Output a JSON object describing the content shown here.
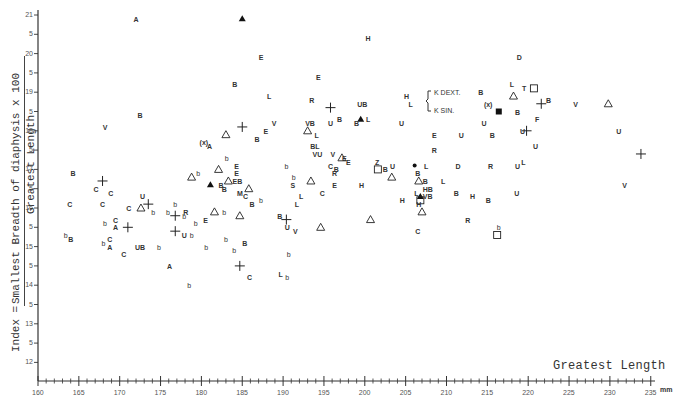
{
  "chart_data": {
    "type": "scatter",
    "title": "",
    "xlabel": "Greatest Length",
    "x_unit": "mm",
    "ylabel": "Index = Smallest Breadth of diaphysis x 100 / Greatest Length",
    "ylabel_parts": {
      "prefix": "Index =",
      "numerator": "Smallest Breadth of diaphysis x 100",
      "denominator": "Greatest Length"
    },
    "xlim": [
      160,
      235
    ],
    "ylim": [
      11.5,
      21.2
    ],
    "x_ticks": [
      "160",
      "165",
      "170",
      "175",
      "180",
      "185",
      "190",
      "195",
      "200",
      "205",
      "210",
      "215",
      "220",
      "225",
      "230",
      "235"
    ],
    "y_ticks": [
      "21",
      "5",
      "20",
      "5",
      "19",
      "5",
      "18",
      "5",
      "17",
      "5",
      "16",
      "5",
      "15",
      "5",
      "14",
      "5",
      "13",
      "5",
      "12"
    ],
    "y_tick_values": [
      21,
      20.5,
      20,
      19.5,
      19,
      18.5,
      18,
      17.5,
      17,
      16.5,
      16,
      15.5,
      15,
      14.5,
      14,
      13.5,
      13,
      12.5,
      12
    ],
    "grid": false,
    "legend": {
      "position": "upper right (inline bracket)",
      "entries": [
        "K DEXT.",
        "K SIN."
      ],
      "bracket_marker": "{"
    },
    "marker_types": [
      "letter codes (A,B,C,D,E,F,H,L,M,R,S,T,U,V,Z,b)",
      "cross +",
      "open triangle",
      "filled triangle",
      "open square",
      "filled square",
      "filled dot",
      "(x)"
    ],
    "points": [
      {
        "m": "A",
        "x": 172.0,
        "y": 20.9
      },
      {
        "m": "filled-triangle",
        "x": 185.0,
        "y": 20.9
      },
      {
        "m": "E",
        "x": 187.3,
        "y": 19.9
      },
      {
        "m": "H",
        "x": 200.4,
        "y": 20.4
      },
      {
        "m": "D",
        "x": 218.9,
        "y": 19.9
      },
      {
        "m": "B",
        "x": 184.1,
        "y": 19.2
      },
      {
        "m": "L",
        "x": 188.3,
        "y": 18.9
      },
      {
        "m": "E",
        "x": 194.3,
        "y": 19.4
      },
      {
        "m": "R",
        "x": 193.5,
        "y": 18.8
      },
      {
        "m": "cross",
        "x": 195.8,
        "y": 18.6
      },
      {
        "m": "UB",
        "x": 199.7,
        "y": 18.7
      },
      {
        "m": "H",
        "x": 205.1,
        "y": 18.9
      },
      {
        "m": "L",
        "x": 205.6,
        "y": 18.7
      },
      {
        "m": "B",
        "x": 214.2,
        "y": 19.0
      },
      {
        "m": "L",
        "x": 218.0,
        "y": 19.2
      },
      {
        "m": "T",
        "x": 219.5,
        "y": 19.1
      },
      {
        "m": "open-triangle",
        "x": 218.2,
        "y": 18.9
      },
      {
        "m": "open-square",
        "x": 220.7,
        "y": 19.1
      },
      {
        "m": "(x)",
        "x": 215.1,
        "y": 18.7
      },
      {
        "m": "filled-square",
        "x": 216.4,
        "y": 18.5
      },
      {
        "m": "B",
        "x": 218.7,
        "y": 18.5
      },
      {
        "m": "B",
        "x": 222.5,
        "y": 18.8
      },
      {
        "m": "cross",
        "x": 221.6,
        "y": 18.7
      },
      {
        "m": "V",
        "x": 225.8,
        "y": 18.7
      },
      {
        "m": "open-triangle",
        "x": 229.8,
        "y": 18.7
      },
      {
        "m": "F",
        "x": 221.1,
        "y": 18.3
      },
      {
        "m": "U",
        "x": 219.3,
        "y": 18.0
      },
      {
        "m": "cross",
        "x": 219.8,
        "y": 18.0
      },
      {
        "m": "U",
        "x": 231.1,
        "y": 18.0
      },
      {
        "m": "U",
        "x": 220.9,
        "y": 17.6
      },
      {
        "m": "V",
        "x": 168.2,
        "y": 18.1
      },
      {
        "m": "B",
        "x": 172.5,
        "y": 18.4
      },
      {
        "m": "cross",
        "x": 185.0,
        "y": 18.1
      },
      {
        "m": "V",
        "x": 188.9,
        "y": 18.2
      },
      {
        "m": "E",
        "x": 187.9,
        "y": 18.0
      },
      {
        "m": "VB",
        "x": 193.3,
        "y": 18.2
      },
      {
        "m": "open-triangle",
        "x": 193.0,
        "y": 18.0
      },
      {
        "m": "U",
        "x": 195.8,
        "y": 18.2
      },
      {
        "m": "B",
        "x": 196.9,
        "y": 18.3
      },
      {
        "m": "filled-triangle",
        "x": 199.5,
        "y": 18.3
      },
      {
        "m": "L",
        "x": 200.4,
        "y": 18.3
      },
      {
        "m": "B",
        "x": 199.0,
        "y": 18.2
      },
      {
        "m": "U",
        "x": 204.5,
        "y": 18.2
      },
      {
        "m": "U",
        "x": 214.6,
        "y": 18.2
      },
      {
        "m": "E",
        "x": 208.5,
        "y": 17.9
      },
      {
        "m": "U",
        "x": 211.8,
        "y": 17.9
      },
      {
        "m": "B",
        "x": 215.6,
        "y": 17.9
      },
      {
        "m": "R",
        "x": 208.5,
        "y": 17.5
      },
      {
        "m": "open-triangle",
        "x": 183.0,
        "y": 17.9
      },
      {
        "m": "B",
        "x": 186.8,
        "y": 17.8
      },
      {
        "m": "L",
        "x": 194.1,
        "y": 17.9
      },
      {
        "m": "BL",
        "x": 193.9,
        "y": 17.6
      },
      {
        "m": "VU",
        "x": 194.2,
        "y": 17.4
      },
      {
        "m": "(x)",
        "x": 180.3,
        "y": 17.7
      },
      {
        "m": "A",
        "x": 181.0,
        "y": 17.6
      },
      {
        "m": "b",
        "x": 183.1,
        "y": 17.3
      },
      {
        "m": "E",
        "x": 184.3,
        "y": 17.1
      },
      {
        "m": "E",
        "x": 184.3,
        "y": 16.9
      },
      {
        "m": "B",
        "x": 164.3,
        "y": 16.9
      },
      {
        "m": "cross",
        "x": 167.9,
        "y": 16.7
      },
      {
        "m": "C",
        "x": 167.1,
        "y": 16.5
      },
      {
        "m": "C",
        "x": 168.9,
        "y": 16.4
      },
      {
        "m": "open-triangle",
        "x": 178.8,
        "y": 16.8
      },
      {
        "m": "b",
        "x": 179.6,
        "y": 16.9
      },
      {
        "m": "open-triangle",
        "x": 182.1,
        "y": 17.0
      },
      {
        "m": "filled-triangle",
        "x": 181.1,
        "y": 16.6
      },
      {
        "m": "B",
        "x": 182.4,
        "y": 16.6
      },
      {
        "m": "open-triangle",
        "x": 183.3,
        "y": 16.7
      },
      {
        "m": "B",
        "x": 182.8,
        "y": 16.5
      },
      {
        "m": "EB",
        "x": 184.4,
        "y": 16.7
      },
      {
        "m": "M",
        "x": 184.7,
        "y": 16.4
      },
      {
        "m": "open-triangle",
        "x": 185.8,
        "y": 16.5
      },
      {
        "m": "C",
        "x": 185.4,
        "y": 16.3
      },
      {
        "m": "B",
        "x": 186.2,
        "y": 16.1
      },
      {
        "m": "b",
        "x": 187.3,
        "y": 16.2
      },
      {
        "m": "b",
        "x": 191.3,
        "y": 16.8
      },
      {
        "m": "open-triangle",
        "x": 197.2,
        "y": 17.3
      },
      {
        "m": "V",
        "x": 196.1,
        "y": 17.4
      },
      {
        "m": "E",
        "x": 197.5,
        "y": 17.3
      },
      {
        "m": "E",
        "x": 198.0,
        "y": 17.2
      },
      {
        "m": "C",
        "x": 195.8,
        "y": 17.1
      },
      {
        "m": "B",
        "x": 196.5,
        "y": 17.0
      },
      {
        "m": "Z",
        "x": 201.5,
        "y": 17.2
      },
      {
        "m": "B",
        "x": 202.5,
        "y": 17.0
      },
      {
        "m": "U",
        "x": 203.4,
        "y": 17.1
      },
      {
        "m": "open-square",
        "x": 201.6,
        "y": 17.0
      },
      {
        "m": "filled-dot",
        "x": 206.1,
        "y": 17.1
      },
      {
        "m": "L",
        "x": 207.5,
        "y": 17.1
      },
      {
        "m": "D",
        "x": 211.4,
        "y": 17.1
      },
      {
        "m": "R",
        "x": 215.4,
        "y": 17.1
      },
      {
        "m": "U",
        "x": 218.7,
        "y": 17.1
      },
      {
        "m": "L",
        "x": 219.4,
        "y": 17.2
      },
      {
        "m": "B",
        "x": 206.5,
        "y": 16.9
      },
      {
        "m": "open-triangle",
        "x": 206.6,
        "y": 16.7
      },
      {
        "m": "B",
        "x": 207.4,
        "y": 16.7
      },
      {
        "m": "L",
        "x": 209.6,
        "y": 16.7
      },
      {
        "m": "C",
        "x": 167.9,
        "y": 16.1
      },
      {
        "m": "U",
        "x": 172.8,
        "y": 16.3
      },
      {
        "m": "C",
        "x": 171.1,
        "y": 16.0
      },
      {
        "m": "cross",
        "x": 173.5,
        "y": 16.1
      },
      {
        "m": "open-triangle",
        "x": 172.6,
        "y": 16.0
      },
      {
        "m": "b",
        "x": 174.1,
        "y": 15.9
      },
      {
        "m": "b",
        "x": 176.8,
        "y": 16.1
      },
      {
        "m": "b",
        "x": 175.9,
        "y": 15.9
      },
      {
        "m": "cross",
        "x": 176.8,
        "y": 15.8
      },
      {
        "m": "R",
        "x": 178.1,
        "y": 15.9
      },
      {
        "m": "b",
        "x": 177.9,
        "y": 15.8
      },
      {
        "m": "E",
        "x": 180.5,
        "y": 15.7
      },
      {
        "m": "open-triangle",
        "x": 181.6,
        "y": 15.9
      },
      {
        "m": "b",
        "x": 182.8,
        "y": 15.9
      },
      {
        "m": "open-triangle",
        "x": 184.7,
        "y": 15.8
      },
      {
        "m": "cross",
        "x": 176.8,
        "y": 15.4
      },
      {
        "m": "U",
        "x": 177.9,
        "y": 15.3
      },
      {
        "m": "b",
        "x": 178.8,
        "y": 15.3
      },
      {
        "m": "b",
        "x": 179.3,
        "y": 15.6
      },
      {
        "m": "C",
        "x": 163.9,
        "y": 16.1
      },
      {
        "m": "b",
        "x": 163.4,
        "y": 15.3
      },
      {
        "m": "B",
        "x": 164.0,
        "y": 15.2
      },
      {
        "m": "b",
        "x": 168.2,
        "y": 15.6
      },
      {
        "m": "C",
        "x": 169.5,
        "y": 15.7
      },
      {
        "m": "A",
        "x": 169.5,
        "y": 15.5
      },
      {
        "m": "cross",
        "x": 171.0,
        "y": 15.5
      },
      {
        "m": "b",
        "x": 168.0,
        "y": 15.1
      },
      {
        "m": "C",
        "x": 168.8,
        "y": 15.2
      },
      {
        "m": "A",
        "x": 168.8,
        "y": 15.0
      },
      {
        "m": "UB",
        "x": 172.5,
        "y": 15.0
      },
      {
        "m": "C",
        "x": 170.5,
        "y": 14.8
      },
      {
        "m": "b",
        "x": 174.8,
        "y": 15.0
      },
      {
        "m": "b",
        "x": 180.6,
        "y": 15.0
      },
      {
        "m": "b",
        "x": 183.0,
        "y": 15.2
      },
      {
        "m": "b",
        "x": 184.0,
        "y": 14.9
      },
      {
        "m": "B",
        "x": 185.3,
        "y": 15.1
      },
      {
        "m": "A",
        "x": 176.1,
        "y": 14.5
      },
      {
        "m": "cross",
        "x": 184.7,
        "y": 14.5
      },
      {
        "m": "C",
        "x": 185.9,
        "y": 14.2
      },
      {
        "m": "b",
        "x": 178.5,
        "y": 14.0
      },
      {
        "m": "b",
        "x": 190.7,
        "y": 14.8
      },
      {
        "m": "L",
        "x": 189.7,
        "y": 14.3
      },
      {
        "m": "b",
        "x": 190.5,
        "y": 14.2
      },
      {
        "m": "V",
        "x": 191.5,
        "y": 15.4
      },
      {
        "m": "B",
        "x": 189.6,
        "y": 15.8
      },
      {
        "m": "cross",
        "x": 190.4,
        "y": 15.7
      },
      {
        "m": "U",
        "x": 190.5,
        "y": 15.5
      },
      {
        "m": "b",
        "x": 190.4,
        "y": 17.1
      },
      {
        "m": "S",
        "x": 191.2,
        "y": 16.6
      },
      {
        "m": "L",
        "x": 192.2,
        "y": 16.3
      },
      {
        "m": "L",
        "x": 191.7,
        "y": 16.1
      },
      {
        "m": "C",
        "x": 194.8,
        "y": 16.4
      },
      {
        "m": "open-triangle",
        "x": 193.4,
        "y": 16.7
      },
      {
        "m": "R",
        "x": 196.3,
        "y": 16.9
      },
      {
        "m": "E",
        "x": 196.3,
        "y": 16.6
      },
      {
        "m": "H",
        "x": 199.6,
        "y": 16.6
      },
      {
        "m": "open-triangle",
        "x": 203.3,
        "y": 16.8
      },
      {
        "m": "open-triangle",
        "x": 194.6,
        "y": 15.5
      },
      {
        "m": "open-triangle",
        "x": 200.7,
        "y": 15.7
      },
      {
        "m": "L",
        "x": 206.3,
        "y": 16.4
      },
      {
        "m": "HB",
        "x": 207.7,
        "y": 16.5
      },
      {
        "m": "filled-triangle",
        "x": 206.8,
        "y": 16.3
      },
      {
        "m": "open-square",
        "x": 206.8,
        "y": 16.2
      },
      {
        "m": "VB",
        "x": 207.7,
        "y": 16.3
      },
      {
        "m": "H",
        "x": 204.6,
        "y": 16.2
      },
      {
        "m": "H",
        "x": 206.6,
        "y": 16.1
      },
      {
        "m": "open-triangle",
        "x": 207.0,
        "y": 15.9
      },
      {
        "m": "C",
        "x": 206.5,
        "y": 15.4
      },
      {
        "m": "B",
        "x": 211.2,
        "y": 16.4
      },
      {
        "m": "H",
        "x": 213.2,
        "y": 16.3
      },
      {
        "m": "B",
        "x": 215.1,
        "y": 16.2
      },
      {
        "m": "U",
        "x": 218.6,
        "y": 16.4
      },
      {
        "m": "R",
        "x": 212.6,
        "y": 15.7
      },
      {
        "m": "b",
        "x": 216.4,
        "y": 15.5
      },
      {
        "m": "open-square",
        "x": 216.2,
        "y": 15.3
      },
      {
        "m": "V",
        "x": 231.8,
        "y": 16.6
      },
      {
        "m": "cross",
        "x": 233.8,
        "y": 17.4
      }
    ]
  },
  "legend_entries": [
    "K DEXT.",
    "K SIN."
  ]
}
